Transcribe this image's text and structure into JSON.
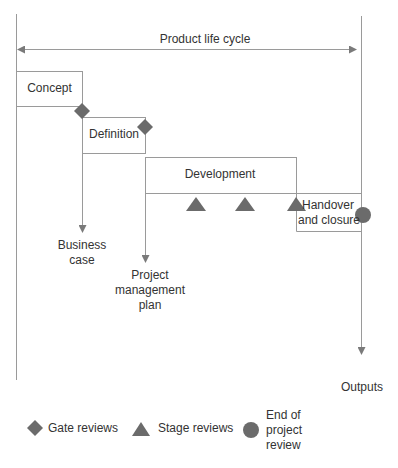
{
  "diagram": {
    "title": "Product life cycle",
    "phases": [
      {
        "label": "Concept"
      },
      {
        "label": "Definition"
      },
      {
        "label": "Development"
      },
      {
        "label": "Handover and closure",
        "lines": [
          "Handover",
          "and closure"
        ]
      }
    ],
    "outputs": [
      {
        "lines": [
          "Business",
          "case"
        ]
      },
      {
        "lines": [
          "Project",
          "management",
          "plan"
        ]
      },
      {
        "lines": [
          "Outputs"
        ]
      }
    ],
    "legend": [
      {
        "icon": "diamond-icon",
        "label": "Gate reviews"
      },
      {
        "icon": "triangle-icon",
        "label": "Stage reviews"
      },
      {
        "icon": "circle-icon",
        "lines": [
          "End of",
          "project",
          "review"
        ]
      }
    ],
    "colors": {
      "line": "#9a9a9a",
      "marker": "#6b6b6b",
      "text": "#333333"
    }
  }
}
